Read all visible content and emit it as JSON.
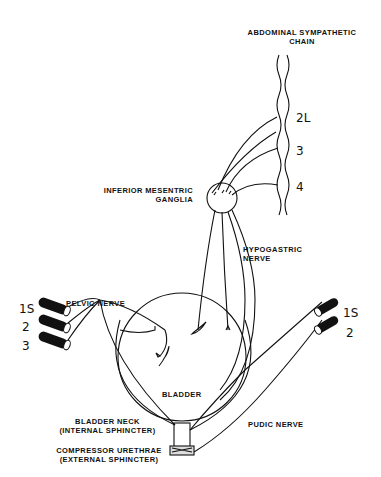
{
  "labels": {
    "sympathetic_chain_line1": "ABDOMINAL SYMPATHETIC",
    "sympathetic_chain_line2": "CHAIN",
    "ganglia_line1": "INFERIOR MESENTRIC",
    "ganglia_line2": "GANGLIA",
    "hypogastric_line1": "HYPOGASTRIC",
    "hypogastric_line2": "NERVE",
    "pelvic_nerve": "PELVIC NERVE",
    "bladder": "BLADDER",
    "bladder_neck_line1": "BLADDER NECK",
    "bladder_neck_line2": "(INTERNAL SPHINCTER)",
    "compressor_line1": "COMPRESSOR URETHRAE",
    "compressor_line2": "(EXTERNAL SPHINCTER)",
    "pudic_nerve": "PUDIC NERVE"
  },
  "segments": {
    "lumbar": [
      "2L",
      "3",
      "4"
    ],
    "sacral_left": [
      "1S",
      "2",
      "3"
    ],
    "sacral_right": [
      "1S",
      "2"
    ]
  },
  "colors": {
    "ink": "#111111",
    "background": "#ffffff"
  }
}
